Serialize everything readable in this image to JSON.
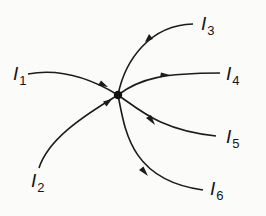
{
  "diagram": {
    "type": "node-junction",
    "node": {
      "x": 118,
      "y": 95
    },
    "currents": [
      {
        "id": "I1",
        "symbol": "I",
        "subscript": "1",
        "direction": "in"
      },
      {
        "id": "I2",
        "symbol": "I",
        "subscript": "2",
        "direction": "in"
      },
      {
        "id": "I3",
        "symbol": "I",
        "subscript": "3",
        "direction": "out"
      },
      {
        "id": "I4",
        "symbol": "I",
        "subscript": "4",
        "direction": "out"
      },
      {
        "id": "I5",
        "symbol": "I",
        "subscript": "5",
        "direction": "out"
      },
      {
        "id": "I6",
        "symbol": "I",
        "subscript": "6",
        "direction": "out"
      }
    ],
    "colors": {
      "line": "#1c1c1c",
      "background": "#fbfbf9"
    }
  }
}
